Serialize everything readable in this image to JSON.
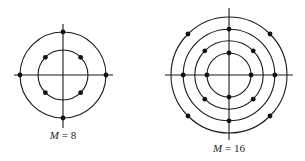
{
  "diagrams": [
    {
      "id": "m8",
      "label_var": "M",
      "label_eq": " = ",
      "label_val": "8",
      "rings": [
        {
          "relative_radius": 1.0,
          "points_angles_deg": [
            0,
            90,
            180,
            270
          ]
        },
        {
          "relative_radius": 0.58,
          "points_angles_deg": [
            45,
            135,
            225,
            315
          ]
        }
      ]
    },
    {
      "id": "m16",
      "label_var": "M",
      "label_eq": " = ",
      "label_val": "16",
      "rings": [
        {
          "relative_radius": 1.0,
          "points_angles_deg": [
            45,
            135,
            225,
            315
          ]
        },
        {
          "relative_radius": 0.79,
          "points_angles_deg": [
            0,
            90,
            180,
            270
          ]
        },
        {
          "relative_radius": 0.59,
          "points_angles_deg": [
            45,
            135,
            225,
            315
          ]
        },
        {
          "relative_radius": 0.38,
          "points_angles_deg": [
            0,
            90,
            180,
            270
          ]
        }
      ]
    }
  ],
  "colors": {
    "line": "#1a1a1a",
    "point": "#111111",
    "background": "#ffffff"
  }
}
